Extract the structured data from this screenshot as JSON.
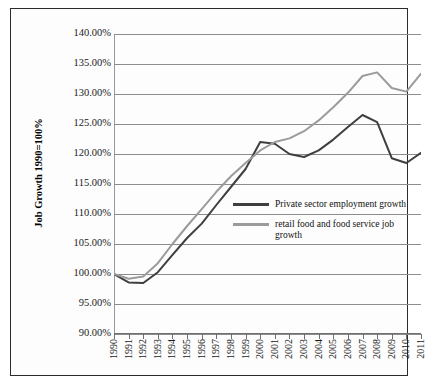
{
  "chart_data": {
    "type": "line",
    "title": "",
    "xlabel": "",
    "ylabel": "Job Growth 1990=100%",
    "ylim": [
      90,
      140
    ],
    "ytick_step": 5,
    "ytick_labels": [
      "140.00%",
      "135.00%",
      "130.00%",
      "125.00%",
      "120.00%",
      "115.00%",
      "110.00%",
      "105.00%",
      "100.00%",
      "95.00%",
      "90.00%"
    ],
    "grid": true,
    "legend_position": "inside-right-middle",
    "categories": [
      "1990",
      "1991",
      "1992",
      "1993",
      "1994",
      "1995",
      "1996",
      "1997",
      "1998",
      "1999",
      "2000",
      "2001",
      "2002",
      "2003",
      "2004",
      "2005",
      "2006",
      "2007",
      "2008",
      "2009",
      "2010",
      "2011"
    ],
    "series": [
      {
        "name": "Private sector employment growth",
        "color": "#3f3f3f",
        "values": [
          100.0,
          98.6,
          98.5,
          100.3,
          103.2,
          106.0,
          108.4,
          111.5,
          114.5,
          117.5,
          122.0,
          121.7,
          120.0,
          119.5,
          120.6,
          122.4,
          124.5,
          126.5,
          125.3,
          119.3,
          118.5,
          120.2
        ]
      },
      {
        "name": "retail food and food service job growth",
        "color": "#9b9b9b",
        "values": [
          100.0,
          99.2,
          99.6,
          101.8,
          105.0,
          108.0,
          110.8,
          113.7,
          116.3,
          118.5,
          120.6,
          122.0,
          122.6,
          123.8,
          125.6,
          127.8,
          130.2,
          133.0,
          133.6,
          131.0,
          130.4,
          133.4
        ]
      }
    ]
  },
  "legend": {
    "items": [
      {
        "label": "Private sector employment growth",
        "color": "#3f3f3f"
      },
      {
        "label": "retail food and food service job growth",
        "color": "#9b9b9b"
      }
    ]
  },
  "axis": {
    "y_title": "Job Growth 1990=100%"
  }
}
